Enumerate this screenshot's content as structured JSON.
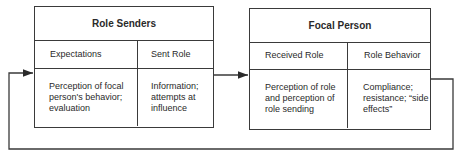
{
  "diagram": {
    "boxes": [
      {
        "title": "Role Senders",
        "columns": [
          {
            "header": "Expectations",
            "body": "Perception of focal person's behavior; evaluation"
          },
          {
            "header": "Sent Role",
            "body": "Information; attempts at influence"
          }
        ]
      },
      {
        "title": "Focal Person",
        "columns": [
          {
            "header": "Received Role",
            "body": "Perception of role and perception of role sending"
          },
          {
            "header": "Role Behavior",
            "body": "Compliance; resistance; “side effects”"
          }
        ]
      }
    ],
    "connections": [
      {
        "from": "Role Senders",
        "to": "Focal Person",
        "type": "arrow"
      },
      {
        "from": "Focal Person",
        "to": "Role Senders",
        "type": "feedback-arrow"
      }
    ]
  }
}
